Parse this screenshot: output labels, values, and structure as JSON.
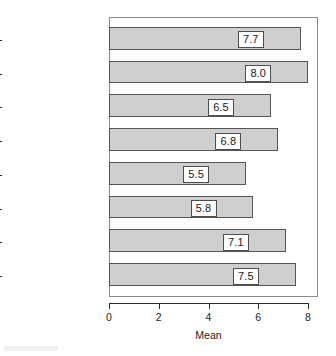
{
  "chart_data": {
    "type": "bar",
    "orientation": "horizontal",
    "title": "",
    "subtitle": "",
    "xlabel": "Mean",
    "ylabel": "",
    "categories": [
      "Ref standard",
      "Refereeing speed",
      "Editor/board",
      "Production speed",
      "Physical quality",
      "Publ services",
      "Impact factor",
      "Reputation"
    ],
    "values": [
      7.7,
      8.0,
      6.5,
      6.8,
      5.5,
      5.8,
      7.1,
      7.5
    ],
    "data_labels": [
      "7.7",
      "8.0",
      "6.5",
      "6.8",
      "5.5",
      "5.8",
      "7.1",
      "7.5"
    ],
    "xlim": [
      0,
      8.2
    ],
    "xticks": [
      0,
      2,
      4,
      6,
      8
    ],
    "xtick_labels": [
      "0",
      "2",
      "4",
      "6",
      "8"
    ],
    "grid": false,
    "legend": null,
    "colors": {
      "bar_fill": "#cfcfcf",
      "bar_border": "#555555",
      "axis": "#2b2b2b",
      "frame": "#8a8a8a",
      "text": "#1c1c1c",
      "label_box_fill": "#ffffff",
      "label_box_border": "#4d4d4d",
      "background": "#ffffff"
    }
  }
}
